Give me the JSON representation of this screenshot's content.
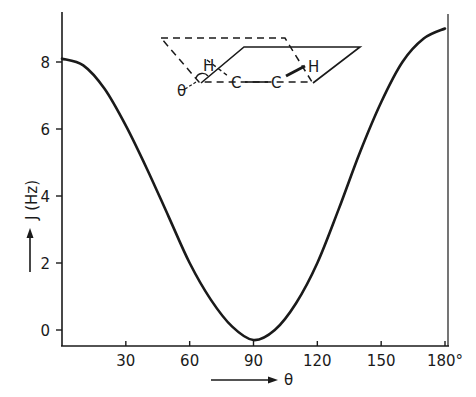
{
  "chart_data": {
    "type": "line",
    "title": "",
    "xlabel": "θ",
    "ylabel": "J (Hz)",
    "x_unit_suffix": "°",
    "xlim": [
      0,
      180
    ],
    "ylim": [
      -0.5,
      9.2
    ],
    "xticks": [
      30,
      60,
      90,
      120,
      150,
      180
    ],
    "xtick_labels": [
      "30",
      "60",
      "90",
      "120",
      "150",
      "180°"
    ],
    "yticks": [
      0,
      2,
      4,
      6,
      8
    ],
    "ytick_labels": [
      "0",
      "2",
      "4",
      "6",
      "8"
    ],
    "grid": false,
    "legend": null,
    "series": [
      {
        "name": "Karplus curve",
        "x": [
          0,
          10,
          20,
          30,
          40,
          50,
          60,
          70,
          80,
          90,
          100,
          110,
          120,
          130,
          140,
          150,
          160,
          170,
          180
        ],
        "values": [
          8.1,
          7.9,
          7.2,
          6.1,
          4.8,
          3.4,
          2.0,
          0.9,
          0.1,
          -0.3,
          0.0,
          0.8,
          2.0,
          3.6,
          5.3,
          6.8,
          8.0,
          8.7,
          9.0
        ]
      }
    ],
    "annotations": [
      "Inset: H–C–C–H dihedral projection diagram with angle θ marked between two planes"
    ]
  },
  "inset": {
    "h_left": "H",
    "c_left": "C",
    "c_right": "C",
    "h_right": "H",
    "theta": "θ"
  },
  "labels": {
    "y_axis": "J (Hz)",
    "x_axis": "θ"
  }
}
